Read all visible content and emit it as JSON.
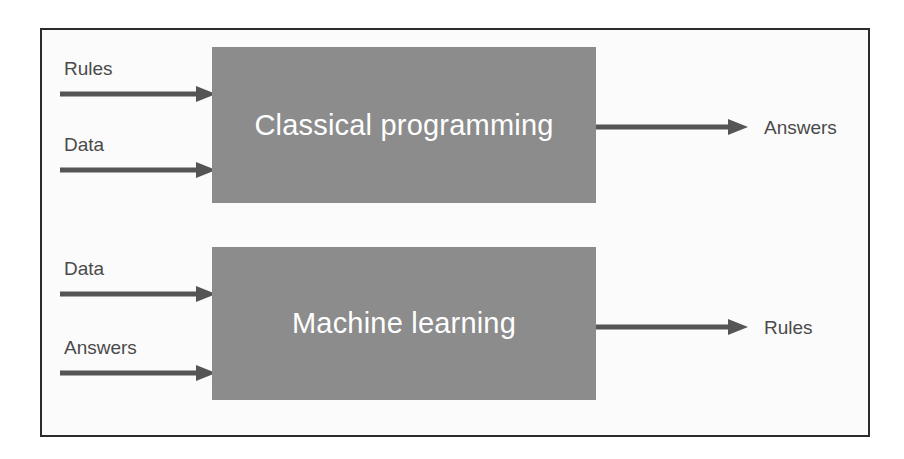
{
  "diagram": {
    "background_color": "#ffffff",
    "frame_border_color": "#2b2b2b",
    "box_fill_color": "#8c8c8c",
    "box_text_color": "#ffffff",
    "arrow_color": "#555555",
    "label_text_color": "#4a4a4a",
    "rows": [
      {
        "id": "classical-programming",
        "process_label": "Classical programming",
        "inputs": [
          {
            "label": "Rules"
          },
          {
            "label": "Data"
          }
        ],
        "outputs": [
          {
            "label": "Answers"
          }
        ]
      },
      {
        "id": "machine-learning",
        "process_label": "Machine learning",
        "inputs": [
          {
            "label": "Data"
          },
          {
            "label": "Answers"
          }
        ],
        "outputs": [
          {
            "label": "Rules"
          }
        ]
      }
    ]
  }
}
